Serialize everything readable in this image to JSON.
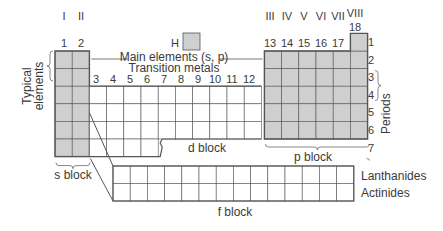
{
  "diagram": {
    "group_roman": [
      "I",
      "II",
      "III",
      "IV",
      "V",
      "VI",
      "VII",
      "VIII"
    ],
    "group_numbers_s": [
      "1",
      "2"
    ],
    "group_numbers_d": [
      "3",
      "4",
      "5",
      "6",
      "7",
      "8",
      "9",
      "10",
      "11",
      "12"
    ],
    "group_numbers_p": [
      "13",
      "14",
      "15",
      "16",
      "17",
      "18"
    ],
    "periods": [
      "1",
      "2",
      "3",
      "4",
      "5",
      "6",
      "7"
    ],
    "labels": {
      "hydrogen": "H",
      "main_elements": "Main elements (s, p)",
      "transition_metals": "Transition metals",
      "typical_elements_1": "Typical",
      "typical_elements_2": "elements",
      "periods": "Periods",
      "s_block": "s block",
      "d_block": "d block",
      "p_block": "p block",
      "f_block": "f block",
      "lanthanides": "Lanthanides",
      "actinides": "Actinides"
    },
    "colors": {
      "main_fill": "#cfcfcf",
      "transition_fill": "#ffffff",
      "grid_line": "#555555",
      "text": "#3a3a3a"
    }
  }
}
